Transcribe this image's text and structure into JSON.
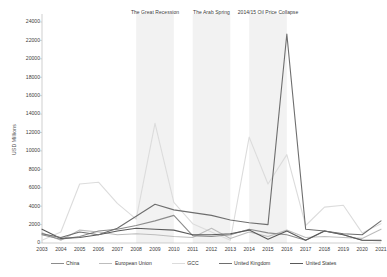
{
  "chart_data": {
    "type": "line",
    "title": "",
    "xlabel": "",
    "ylabel": "USD Millions",
    "ylim": [
      0,
      24000
    ],
    "ytick_step": 2000,
    "grid": false,
    "legend_position": "bottom",
    "categories": [
      2003,
      2004,
      2005,
      2006,
      2007,
      2008,
      2009,
      2010,
      2011,
      2012,
      2013,
      2014,
      2015,
      2016,
      2017,
      2018,
      2019,
      2020,
      2021
    ],
    "yticks": [
      0,
      2000,
      4000,
      6000,
      8000,
      10000,
      12000,
      14000,
      16000,
      18000,
      20000,
      22000,
      24000
    ],
    "series": [
      {
        "name": "China",
        "color": "#8c8c8c",
        "values": [
          900,
          400,
          700,
          1300,
          1500,
          1900,
          2400,
          3000,
          800,
          700,
          900,
          1500,
          1100,
          900,
          300,
          1300,
          900,
          300,
          250
        ]
      },
      {
        "name": "European Union",
        "color": "#bdbdbd",
        "values": [
          1100,
          300,
          1400,
          1200,
          900,
          1000,
          900,
          700,
          600,
          1600,
          500,
          1200,
          700,
          1400,
          600,
          700,
          600,
          500,
          1500
        ]
      },
      {
        "name": "GCC",
        "color": "#dcdcdc",
        "values": [
          300,
          1200,
          6400,
          6600,
          4300,
          2600,
          13000,
          4400,
          2100,
          1200,
          300,
          11500,
          6400,
          9600,
          1900,
          3900,
          4100,
          1100,
          2100
        ]
      },
      {
        "name": "United Kingdom",
        "color": "#6e6e6e",
        "values": [
          1000,
          600,
          1200,
          900,
          1600,
          2900,
          4200,
          3600,
          3300,
          3000,
          2500,
          2200,
          2000,
          22700,
          1500,
          1300,
          1000,
          900,
          2400
        ]
      },
      {
        "name": "United States",
        "color": "#595959",
        "values": [
          1500,
          500,
          600,
          900,
          1300,
          1600,
          1500,
          1400,
          900,
          900,
          1000,
          1400,
          400,
          1300,
          300,
          1300,
          900,
          300,
          300
        ]
      }
    ],
    "shaded_bands": [
      {
        "label": "The Great Recession",
        "start": 2008,
        "end": 2010,
        "color": "#f2f2f2"
      },
      {
        "label": "The Arab Spring",
        "start": 2011,
        "end": 2013,
        "color": "#f2f2f2"
      },
      {
        "label": "2014/15 Oil Price Collapse",
        "start": 2014,
        "end": 2016,
        "color": "#f2f2f2"
      }
    ]
  },
  "legend": {
    "items": [
      {
        "label": "China"
      },
      {
        "label": "European Union"
      },
      {
        "label": "GCC"
      },
      {
        "label": "United Kingdom"
      },
      {
        "label": "United States"
      }
    ]
  }
}
